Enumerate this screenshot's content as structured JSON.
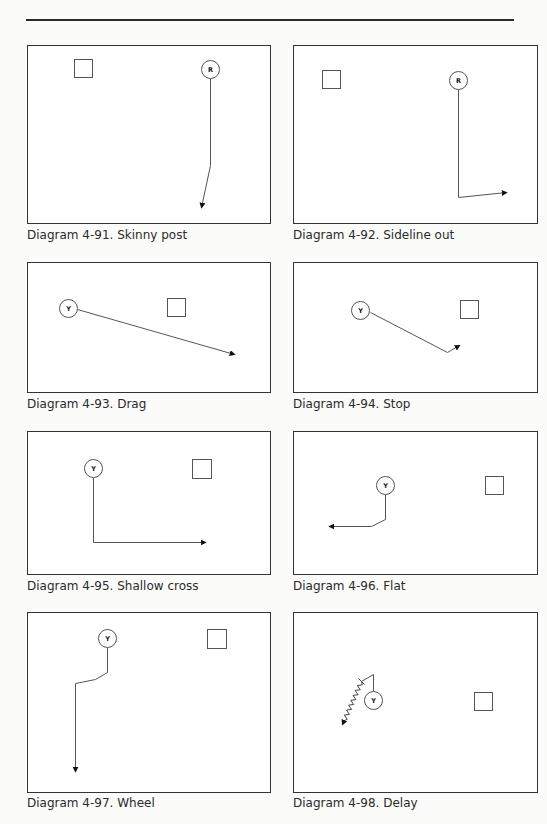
{
  "page": {
    "top_rule": true
  },
  "diagrams": [
    {
      "id": "4-91",
      "caption": "Diagram 4-91. Skinny post",
      "route": "Skinny post",
      "player_label": "R",
      "box": {
        "x": 27,
        "y": 45,
        "w": 244,
        "h": 179
      },
      "square": {
        "x": 75,
        "y": 60,
        "size": 18
      },
      "player": {
        "cx": 211,
        "cy": 70,
        "r": 9
      },
      "path": [
        [
          211,
          79
        ],
        [
          211,
          166
        ],
        [
          202,
          208
        ]
      ],
      "arrow_end": [
        202,
        208
      ],
      "caption_y": 236
    },
    {
      "id": "4-92",
      "caption": "Diagram 4-92. Sideline out",
      "route": "Sideline out",
      "player_label": "R",
      "box": {
        "x": 293,
        "y": 45,
        "w": 245,
        "h": 179
      },
      "square": {
        "x": 323,
        "y": 71,
        "size": 18
      },
      "player": {
        "cx": 459,
        "cy": 81,
        "r": 9
      },
      "path": [
        [
          459,
          90
        ],
        [
          459,
          198
        ],
        [
          507,
          193
        ]
      ],
      "arrow_end": [
        507,
        193
      ],
      "caption_y": 236
    },
    {
      "id": "4-93",
      "caption": "Diagram 4-93. Drag",
      "route": "Drag",
      "player_label": "Y",
      "box": {
        "x": 27,
        "y": 262,
        "w": 244,
        "h": 131
      },
      "square": {
        "x": 168,
        "y": 299,
        "size": 18
      },
      "player": {
        "cx": 69,
        "cy": 309,
        "r": 9
      },
      "path": [
        [
          78,
          310
        ],
        [
          235,
          355
        ]
      ],
      "arrow_end": [
        235,
        355
      ],
      "caption_y": 405
    },
    {
      "id": "4-94",
      "caption": "Diagram 4-94. Stop",
      "route": "Stop",
      "player_label": "Y",
      "box": {
        "x": 293,
        "y": 262,
        "w": 245,
        "h": 131
      },
      "square": {
        "x": 461,
        "y": 301,
        "size": 18
      },
      "player": {
        "cx": 361,
        "cy": 311,
        "r": 9
      },
      "path": [
        [
          371,
          313
        ],
        [
          448,
          353
        ],
        [
          460,
          346
        ]
      ],
      "arrow_end": [
        460,
        346
      ],
      "caption_y": 405
    },
    {
      "id": "4-95",
      "caption": "Diagram 4-95. Shallow cross",
      "route": "Shallow cross",
      "player_label": "Y",
      "box": {
        "x": 27,
        "y": 431,
        "w": 244,
        "h": 144
      },
      "square": {
        "x": 193,
        "y": 460,
        "size": 19
      },
      "player": {
        "cx": 94,
        "cy": 469,
        "r": 9
      },
      "path": [
        [
          94,
          478
        ],
        [
          94,
          543
        ],
        [
          206,
          543
        ]
      ],
      "arrow_end": [
        206,
        543
      ],
      "caption_y": 587
    },
    {
      "id": "4-96",
      "caption": "Diagram 4-96. Flat",
      "route": "Flat",
      "player_label": "Y",
      "box": {
        "x": 293,
        "y": 431,
        "w": 245,
        "h": 144
      },
      "square": {
        "x": 486,
        "y": 477,
        "size": 18
      },
      "player": {
        "cx": 386,
        "cy": 486,
        "r": 9
      },
      "path": [
        [
          386,
          495
        ],
        [
          386,
          520
        ],
        [
          372,
          527
        ],
        [
          330,
          527
        ]
      ],
      "arrow_end": [
        330,
        527
      ],
      "caption_y": 587
    },
    {
      "id": "4-97",
      "caption": "Diagram 4-97. Wheel",
      "route": "Wheel",
      "player_label": "Y",
      "box": {
        "x": 27,
        "y": 612,
        "w": 244,
        "h": 181
      },
      "square": {
        "x": 208,
        "y": 630,
        "size": 19
      },
      "player": {
        "cx": 108,
        "cy": 639,
        "r": 9
      },
      "path": [
        [
          108,
          648
        ],
        [
          108,
          673
        ],
        [
          96,
          680
        ],
        [
          76,
          684
        ],
        [
          76,
          772
        ]
      ],
      "arrow_end": [
        76,
        772
      ],
      "caption_y": 804
    },
    {
      "id": "4-98",
      "caption": "Diagram 4-98. Delay",
      "route": "Delay",
      "player_label": "Y",
      "box": {
        "x": 293,
        "y": 612,
        "w": 245,
        "h": 181
      },
      "square": {
        "x": 475,
        "y": 693,
        "size": 18
      },
      "player": {
        "cx": 374,
        "cy": 701,
        "r": 9
      },
      "path": [
        [
          374,
          692
        ],
        [
          374,
          675
        ],
        [
          362,
          682
        ]
      ],
      "zigzag": {
        "from": [
          362,
          682
        ],
        "to": [
          343,
          725
        ]
      },
      "arrow_end": [
        343,
        725
      ],
      "caption_y": 804
    }
  ]
}
